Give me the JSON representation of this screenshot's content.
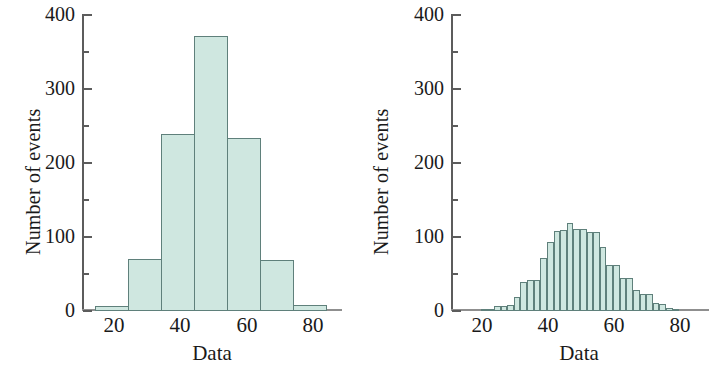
{
  "figure": {
    "background": "#ffffff",
    "bar_fill": "#cfe7e0",
    "bar_stroke": "#5f807b",
    "axis_color": "#5c5c5c"
  },
  "panels": [
    {
      "id": "left",
      "xlabel": "Data",
      "ylabel": "Number of events",
      "ytick_labels": [
        "400",
        "300",
        "200",
        "100",
        "0"
      ],
      "xtick_labels": [
        "20",
        "40",
        "60",
        "80"
      ]
    },
    {
      "id": "right",
      "xlabel": "Data",
      "ylabel": "Number of events",
      "ytick_labels": [
        "400",
        "300",
        "200",
        "100",
        "0"
      ],
      "xtick_labels": [
        "20",
        "40",
        "60",
        "80"
      ]
    }
  ],
  "chart_data": [
    {
      "type": "bar",
      "title": "",
      "subtitle": "",
      "xlabel": "Data",
      "ylabel": "Number of events",
      "xlim": [
        11,
        89
      ],
      "ylim": [
        0,
        400
      ],
      "grid": false,
      "legend": "none",
      "yticks_major": [
        0,
        100,
        200,
        300,
        400
      ],
      "yticks_minor": [
        50,
        150,
        250,
        350
      ],
      "xticks": [
        20,
        40,
        60,
        80
      ],
      "bin_width": 10,
      "bin_edges": [
        15,
        25,
        35,
        45,
        55,
        65,
        75,
        85
      ],
      "bin_centers": [
        20,
        30,
        40,
        50,
        60,
        70,
        80
      ],
      "values": [
        5,
        70,
        238,
        370,
        233,
        68,
        8
      ]
    },
    {
      "type": "bar",
      "title": "",
      "subtitle": "",
      "xlabel": "Data",
      "ylabel": "Number of events",
      "xlim": [
        11,
        89
      ],
      "ylim": [
        0,
        400
      ],
      "grid": false,
      "legend": "none",
      "yticks_major": [
        0,
        100,
        200,
        300,
        400
      ],
      "yticks_minor": [
        50,
        150,
        250,
        350
      ],
      "xticks": [
        20,
        40,
        60,
        80
      ],
      "bin_width": 2,
      "bin_edges": [
        20,
        22,
        24,
        26,
        28,
        30,
        32,
        34,
        36,
        38,
        40,
        42,
        44,
        46,
        48,
        50,
        52,
        54,
        56,
        58,
        60,
        62,
        64,
        66,
        68,
        70,
        72,
        74,
        76,
        78,
        80
      ],
      "bin_centers": [
        21,
        23,
        25,
        27,
        29,
        31,
        33,
        35,
        37,
        39,
        41,
        43,
        45,
        47,
        49,
        51,
        53,
        55,
        57,
        59,
        61,
        63,
        65,
        67,
        69,
        71,
        73,
        75,
        77,
        79
      ],
      "values": [
        1,
        2,
        6,
        6,
        7,
        17,
        38,
        40,
        41,
        70,
        92,
        107,
        108,
        118,
        110,
        110,
        105,
        105,
        85,
        61,
        61,
        43,
        43,
        27,
        21,
        21,
        9,
        8,
        3,
        2
      ]
    }
  ]
}
